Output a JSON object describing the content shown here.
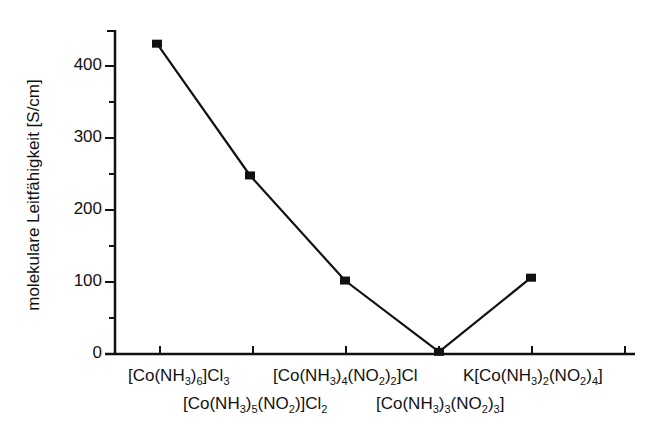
{
  "chart_data": {
    "type": "line",
    "title": "",
    "xlabel": "",
    "ylabel": "molekulare Leitfähigkeit  [S/cm]",
    "ylim": [
      0,
      440
    ],
    "yticks": [
      0,
      100,
      200,
      300,
      400
    ],
    "grid": false,
    "legend": null,
    "categories": [
      "[Co(NH3)6]Cl3",
      "[Co(NH3)5(NO2)]Cl2",
      "[Co(NH3)4(NO2)2]Cl",
      "[Co(NH3)3(NO2)3]",
      "K[Co(NH3)2(NO2)4]"
    ],
    "series": [
      {
        "name": "molekulare Leitfähigkeit",
        "marker": "square",
        "values": [
          431,
          248,
          102,
          3,
          106
        ]
      }
    ]
  },
  "labels": {
    "ylabel": "molekulare Leitfähigkeit  [S/cm]",
    "yticks": [
      "0",
      "100",
      "200",
      "300",
      "400"
    ],
    "x": [
      {
        "pre": "[Co(NH",
        "parts": [
          [
            "3",
            "sub"
          ],
          [
            ")",
            ""
          ],
          [
            "6",
            "sub"
          ],
          [
            "]Cl",
            ""
          ],
          [
            "3",
            "sub"
          ]
        ]
      },
      {
        "parts": []
      }
    ]
  }
}
